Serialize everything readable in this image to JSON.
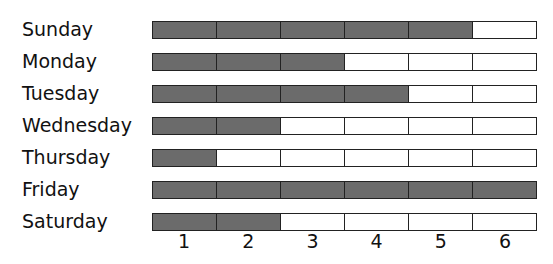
{
  "chart_data": {
    "type": "bar",
    "orientation": "horizontal",
    "title": "",
    "xlabel": "",
    "ylabel": "",
    "categories": [
      "Sunday",
      "Monday",
      "Tuesday",
      "Wednesday",
      "Thursday",
      "Friday",
      "Saturday"
    ],
    "values": [
      5,
      3,
      4,
      2,
      1,
      6,
      2
    ],
    "x_ticks": [
      "1",
      "2",
      "3",
      "4",
      "5",
      "6"
    ],
    "xlim": [
      0,
      6
    ],
    "grid": false,
    "legend": null,
    "colors": {
      "filled": "#6b6b6b",
      "empty": "#ffffff",
      "border": "#222222"
    }
  },
  "rows": [
    {
      "label": "Sunday",
      "value": 5
    },
    {
      "label": "Monday",
      "value": 3
    },
    {
      "label": "Tuesday",
      "value": 4
    },
    {
      "label": "Wednesday",
      "value": 2
    },
    {
      "label": "Thursday",
      "value": 1
    },
    {
      "label": "Friday",
      "value": 6
    },
    {
      "label": "Saturday",
      "value": 2
    }
  ],
  "axis": {
    "ticks": [
      "1",
      "2",
      "3",
      "4",
      "5",
      "6"
    ]
  }
}
